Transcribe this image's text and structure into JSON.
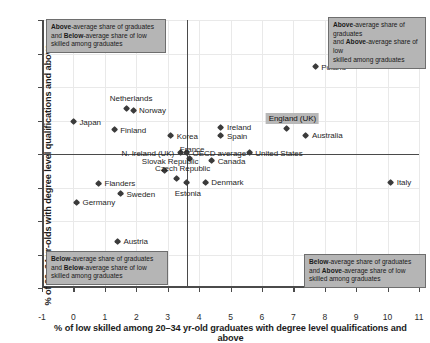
{
  "chart_data": {
    "type": "scatter",
    "title": "",
    "xlabel": "% of low skilled among 20–34 yr-old graduates with degree level qualifications and above",
    "ylabel": "% of 20–34 yr-olds with degree level qualifications and above",
    "xlim": [
      -1,
      11
    ],
    "ylim": [
      5,
      45
    ],
    "xticks": [
      "-1",
      "0",
      "1",
      "2",
      "3",
      "4",
      "5",
      "6",
      "7",
      "8",
      "9",
      "10",
      "11"
    ],
    "yticks": [
      "5",
      "10",
      "15",
      "20",
      "25",
      "30",
      "35",
      "40",
      "45"
    ],
    "grid": true,
    "legend": "none",
    "reference_lines": {
      "vertical_x": 3.6,
      "horizontal_y": 25.0
    },
    "points": [
      {
        "label": "Japan",
        "x": 0.0,
        "y": 29.8,
        "pos": "right"
      },
      {
        "label": "Netherlands",
        "x": 1.7,
        "y": 31.8,
        "pos": "above"
      },
      {
        "label": "Norway",
        "x": 1.9,
        "y": 31.5,
        "pos": "right"
      },
      {
        "label": "Finland",
        "x": 1.3,
        "y": 28.6,
        "pos": "right"
      },
      {
        "label": "Korea",
        "x": 3.1,
        "y": 27.7,
        "pos": "right"
      },
      {
        "label": "Ireland",
        "x": 4.7,
        "y": 29.0,
        "pos": "right"
      },
      {
        "label": "Spain",
        "x": 4.7,
        "y": 27.7,
        "pos": "right"
      },
      {
        "label": "Poland",
        "x": 7.7,
        "y": 38.0,
        "pos": "right"
      },
      {
        "label": "England (UK)",
        "x": 6.8,
        "y": 28.8,
        "pos": "above",
        "highlight": true
      },
      {
        "label": "Australia",
        "x": 7.4,
        "y": 27.8,
        "pos": "right"
      },
      {
        "label": "United States",
        "x": 5.6,
        "y": 25.2,
        "pos": "right"
      },
      {
        "label": "N. Ireland (UK)",
        "x": 3.4,
        "y": 25.2,
        "pos": "left"
      },
      {
        "label": "OECD average",
        "x": 3.6,
        "y": 25.2,
        "pos": "right"
      },
      {
        "label": "France",
        "x": 3.7,
        "y": 24.3,
        "pos": "above"
      },
      {
        "label": "Canada",
        "x": 4.4,
        "y": 24.0,
        "pos": "right"
      },
      {
        "label": "Slovak Republic",
        "x": 2.9,
        "y": 22.5,
        "pos": "above"
      },
      {
        "label": "Czech Republic",
        "x": 3.3,
        "y": 21.4,
        "pos": "above"
      },
      {
        "label": "Estonia",
        "x": 3.6,
        "y": 20.7,
        "pos": "below"
      },
      {
        "label": "Denmark",
        "x": 4.2,
        "y": 20.8,
        "pos": "right"
      },
      {
        "label": "Italy",
        "x": 10.1,
        "y": 20.8,
        "pos": "right"
      },
      {
        "label": "Flanders",
        "x": 0.8,
        "y": 20.6,
        "pos": "right"
      },
      {
        "label": "Sweden",
        "x": 1.5,
        "y": 19.1,
        "pos": "right"
      },
      {
        "label": "Germany",
        "x": 0.1,
        "y": 17.8,
        "pos": "right"
      },
      {
        "label": "Austria",
        "x": 1.4,
        "y": 12.0,
        "pos": "right"
      }
    ],
    "annotations": [
      {
        "id": "top-left",
        "line1_bold": "Above",
        "line1_rest": "-average share of graduates",
        "line2_bold": "Below",
        "line2_pre": "and ",
        "line2_rest": "-average share of low",
        "line3": "skilled among graduates"
      },
      {
        "id": "top-right",
        "line1_bold": "Above",
        "line1_rest": "-average share of graduates",
        "line2_bold": "Above",
        "line2_pre": "and ",
        "line2_rest": "-average share of low",
        "line3": "skilled among graduates"
      },
      {
        "id": "bottom-left",
        "line1_bold": "Below",
        "line1_rest": "-average share of graduates",
        "line2_bold": "Below",
        "line2_pre": "and ",
        "line2_rest": "-average share of low",
        "line3": "skilled among graduates"
      },
      {
        "id": "bottom-right",
        "line1_bold": "Below",
        "line1_rest": "-average share of graduates",
        "line2_bold": "Above",
        "line2_pre": "and ",
        "line2_rest": "-average share of low",
        "line3": "skilled among graduates"
      }
    ],
    "colors": {
      "marker": "#3b3b3b",
      "grid": "#e9e9e9",
      "axis": "#4b4b4b",
      "annotation_bg": "#b5b5b5",
      "highlight_bg": "#b8b8b8"
    }
  }
}
